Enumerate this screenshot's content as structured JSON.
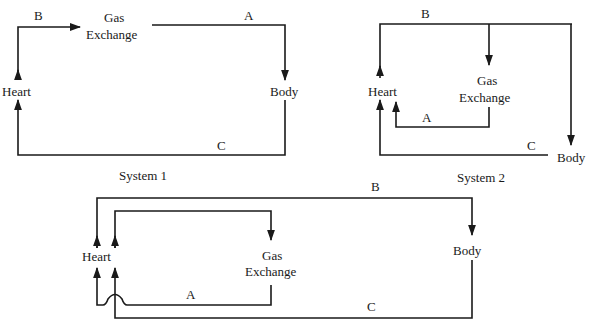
{
  "diagram": {
    "type": "circulatory-system-flow-diagrams",
    "line_color": "#1a1a1a",
    "background": "#ffffff",
    "systems": [
      {
        "caption": "System 1",
        "nodes": {
          "heart": "Heart",
          "gas_exchange_line1": "Gas",
          "gas_exchange_line2": "Exchange",
          "body": "Body"
        },
        "paths": {
          "a": "A",
          "b": "B",
          "c": "C"
        },
        "flow": [
          "Heart -B-> Gas Exchange",
          "Gas Exchange -A-> Body",
          "Body -C-> Heart"
        ]
      },
      {
        "caption": "System 2",
        "nodes": {
          "heart": "Heart",
          "gas_exchange_line1": "Gas",
          "gas_exchange_line2": "Exchange",
          "body": "Body"
        },
        "paths": {
          "a": "A",
          "b": "B",
          "c": "C"
        },
        "flow": [
          "Heart -B-> Gas Exchange",
          "Heart -B-> Body",
          "Gas Exchange -A-> Heart",
          "Body -C-> Heart"
        ]
      },
      {
        "caption": "",
        "nodes": {
          "heart": "Heart",
          "gas_exchange_line1": "Gas",
          "gas_exchange_line2": "Exchange",
          "body": "Body"
        },
        "paths": {
          "a": "A",
          "b": "B",
          "c": "C"
        },
        "flow": [
          "Heart -> Gas Exchange",
          "Gas Exchange -A-> Heart",
          "Heart -B-> Body",
          "Body -C-> Heart"
        ]
      }
    ]
  }
}
